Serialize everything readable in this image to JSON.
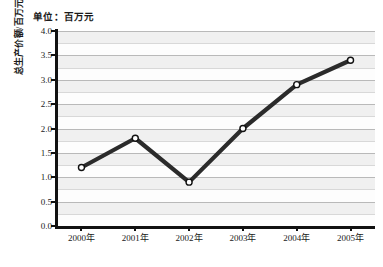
{
  "chart_data": {
    "type": "line",
    "title": "单位：百万元",
    "xlabel": "",
    "ylabel": "总生产价额/百万元",
    "categories": [
      "2000年",
      "2001年",
      "2002年",
      "2003年",
      "2004年",
      "2005年"
    ],
    "values": [
      1.2,
      1.8,
      0.9,
      2.0,
      2.9,
      3.4
    ],
    "series": [
      {
        "name": "总生产价额",
        "values": [
          1.2,
          1.8,
          0.9,
          2.0,
          2.9,
          3.4
        ]
      }
    ],
    "ylim": [
      0.0,
      4.0
    ],
    "ytick_labels": [
      "0.0",
      "0.5",
      "1.0",
      "1.5",
      "2.0",
      "2.5",
      "3.0",
      "3.5",
      "4.0"
    ],
    "ytick_values": [
      0.0,
      0.5,
      1.0,
      1.5,
      2.0,
      2.5,
      3.0,
      3.5,
      4.0
    ],
    "ytick_interval": 0.5,
    "minor_gridline_interval": 0.25,
    "grid": true,
    "legend": false,
    "legend_position": "none",
    "marker": "open-circle",
    "line_color": "#2b2b2b",
    "marker_fill": "#ffffff",
    "marker_stroke": "#111111",
    "band_color": "#f0f0f0",
    "gridline_color": "#b9b9b9",
    "axis_color": "#111111",
    "plot_background": "#fdfdfd",
    "page_background": "#ffffff"
  }
}
